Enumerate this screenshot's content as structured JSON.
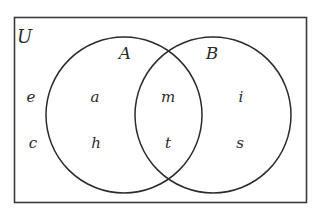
{
  "diagram": {
    "type": "venn",
    "universe_label": "U",
    "sets": [
      {
        "id": "A",
        "label": "A"
      },
      {
        "id": "B",
        "label": "B"
      }
    ],
    "regions": {
      "only_U": [
        "e",
        "c"
      ],
      "only_A": [
        "a",
        "h"
      ],
      "A_and_B": [
        "m",
        "t"
      ],
      "only_B": [
        "i",
        "s"
      ]
    },
    "colors": {
      "stroke": "#2b2b2b",
      "text": "#2b2b2b",
      "background": "#ffffff"
    }
  }
}
